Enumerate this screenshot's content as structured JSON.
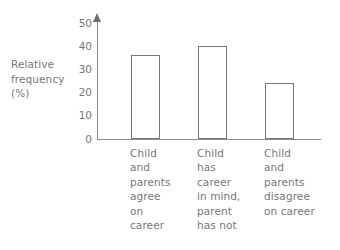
{
  "chart_data": {
    "type": "bar",
    "title": "",
    "xlabel": "",
    "ylabel": "Relative frequency (%)",
    "ylabel_lines": [
      "Relative",
      "frequency",
      "(%)"
    ],
    "ylim": [
      0,
      50
    ],
    "yticks": [
      0,
      10,
      20,
      30,
      40,
      50
    ],
    "ytick_labels": [
      "0",
      "10",
      "20",
      "30",
      "40",
      "50"
    ],
    "grid": false,
    "legend": false,
    "legend_position": "none",
    "axis_arrow": "y-axis-up",
    "bar_fill": "#ffffff",
    "bar_stroke": "#76777a",
    "categories": [
      "Child and parents agree on career",
      "Child has career in mind, parent has not",
      "Child and parents disagree on career"
    ],
    "category_label_lines": [
      [
        "Child",
        "and",
        "parents",
        "agree",
        "on",
        "career"
      ],
      [
        "Child",
        "has",
        "career",
        "in mind,",
        "parent",
        "has not"
      ],
      [
        "Child",
        "and",
        "parents",
        "disagree",
        "on career"
      ]
    ],
    "values": [
      36,
      40,
      24
    ]
  },
  "colors": {
    "ink": "#76777a",
    "axis": "#8b8c8e",
    "background": "#ffffff"
  }
}
